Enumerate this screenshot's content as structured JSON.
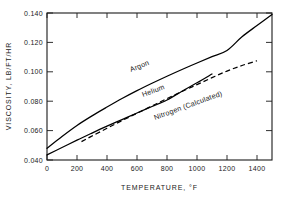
{
  "chart_data": {
    "type": "line",
    "title": "",
    "xlabel": "TEMPERATURE, °F",
    "ylabel": "VISCOSITY, LB/FT/HR",
    "xlim": [
      0,
      1500
    ],
    "ylim": [
      0.04,
      0.14
    ],
    "grid": false,
    "legend_position": "inline-curve-labels",
    "xticks": [
      0,
      200,
      400,
      600,
      800,
      1000,
      1200,
      1400
    ],
    "xtick_labels": [
      "0",
      "200",
      "400",
      "600",
      "800",
      "1000",
      "1200",
      "1400"
    ],
    "yticks": [
      0.04,
      0.06,
      0.08,
      0.1,
      0.12,
      0.14
    ],
    "ytick_labels": [
      "0.040",
      "0.060",
      "0.080",
      "0.100",
      "0.120",
      "0.140"
    ],
    "series": [
      {
        "name": "Argon",
        "style": "solid",
        "label_text": "Argon",
        "x": [
          0,
          100,
          200,
          300,
          400,
          500,
          600,
          700,
          800,
          900,
          1000,
          1100,
          1200,
          1300,
          1400,
          1500
        ],
        "y": [
          0.048,
          0.056,
          0.0635,
          0.07,
          0.076,
          0.0818,
          0.0872,
          0.0922,
          0.097,
          0.1016,
          0.106,
          0.1103,
          0.1145,
          0.1238,
          0.1315,
          0.139
        ]
      },
      {
        "name": "Helium",
        "style": "solid",
        "label_text": "Helium",
        "x": [
          0,
          100,
          200,
          300,
          400,
          500,
          600,
          700,
          800,
          900,
          1000,
          1100
        ],
        "y": [
          0.0435,
          0.0485,
          0.0535,
          0.0583,
          0.063,
          0.0675,
          0.072,
          0.0764,
          0.0808,
          0.0868,
          0.0925,
          0.0985
        ]
      },
      {
        "name": "Nitrogen (Calculated)",
        "style": "dashed",
        "label_text": "Nitrogen (Calculated)",
        "x": [
          230,
          300,
          400,
          500,
          600,
          700,
          800,
          900,
          1000,
          1100,
          1200,
          1300,
          1400
        ],
        "y": [
          0.0525,
          0.0563,
          0.0616,
          0.0668,
          0.0718,
          0.0768,
          0.0818,
          0.0866,
          0.0913,
          0.096,
          0.1005,
          0.1043,
          0.1075
        ]
      }
    ]
  },
  "axis": {
    "x_title": "TEMPERATURE, °F",
    "y_title": "VISCOSITY, LB/FT/HR"
  },
  "labels": {
    "argon": "Argon",
    "helium": "Helium",
    "nitrogen": "Nitrogen (Calculated)"
  },
  "colors": {
    "ink": "#1a1a1a",
    "curve": "#000000",
    "background": "#ffffff"
  }
}
